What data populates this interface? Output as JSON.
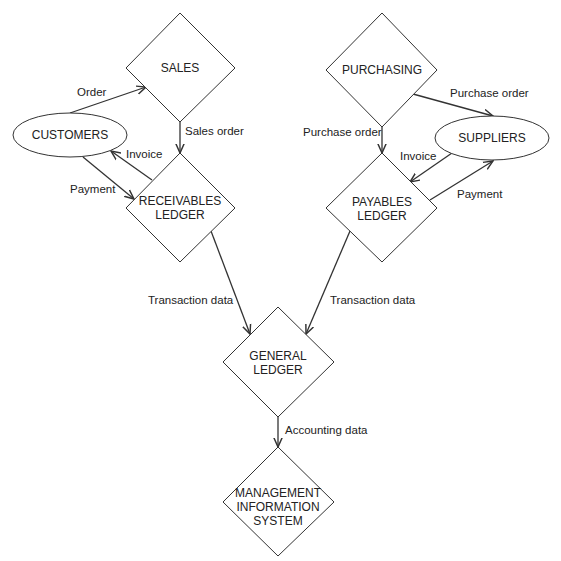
{
  "diagram": {
    "type": "flowchart",
    "stroke_color": "#333333",
    "background": "#ffffff",
    "nodes": [
      {
        "id": "sales",
        "label_lines": [
          "SALES"
        ],
        "shape": "diamond"
      },
      {
        "id": "purchasing",
        "label_lines": [
          "PURCHASING"
        ],
        "shape": "diamond"
      },
      {
        "id": "customers",
        "label_lines": [
          "CUSTOMERS"
        ],
        "shape": "ellipse"
      },
      {
        "id": "suppliers",
        "label_lines": [
          "SUPPLIERS"
        ],
        "shape": "ellipse"
      },
      {
        "id": "receivables",
        "label_lines": [
          "RECEIVABLES",
          "LEDGER"
        ],
        "shape": "diamond"
      },
      {
        "id": "payables",
        "label_lines": [
          "PAYABLES",
          "LEDGER"
        ],
        "shape": "diamond"
      },
      {
        "id": "general",
        "label_lines": [
          "GENERAL",
          "LEDGER"
        ],
        "shape": "diamond"
      },
      {
        "id": "mis",
        "label_lines": [
          "MANAGEMENT",
          "INFORMATION",
          "SYSTEM"
        ],
        "shape": "diamond"
      }
    ],
    "edges": [
      {
        "from": "customers",
        "to": "sales",
        "label": "Order"
      },
      {
        "from": "sales",
        "to": "receivables",
        "label": "Sales order"
      },
      {
        "from": "receivables",
        "to": "customers",
        "label": "Invoice"
      },
      {
        "from": "customers",
        "to": "receivables",
        "label": "Payment"
      },
      {
        "from": "purchasing",
        "to": "suppliers",
        "label": "Purchase order"
      },
      {
        "from": "purchasing",
        "to": "payables",
        "label": "Purchase order"
      },
      {
        "from": "suppliers",
        "to": "payables",
        "label": "Invoice"
      },
      {
        "from": "payables",
        "to": "suppliers",
        "label": "Payment"
      },
      {
        "from": "receivables",
        "to": "general",
        "label": "Transaction data"
      },
      {
        "from": "payables",
        "to": "general",
        "label": "Transaction data"
      },
      {
        "from": "general",
        "to": "mis",
        "label": "Accounting data"
      }
    ]
  }
}
